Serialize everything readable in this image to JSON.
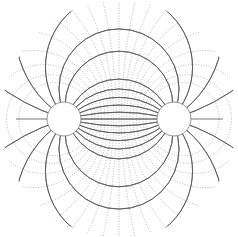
{
  "diagram": {
    "title": "",
    "type": "bipolar-coordinates field lines",
    "width": 238,
    "height": 237,
    "center": [
      119,
      119
    ],
    "focal_half_distance": 52,
    "colors": {
      "background": "#ffffff",
      "field_line": "#555555",
      "equipotential": "#999999",
      "conductor": "#777777"
    },
    "conductors": [
      {
        "name": "left-conductor",
        "cx": 64,
        "cy": 119,
        "r": 17
      },
      {
        "name": "right-conductor",
        "cx": 174,
        "cy": 119,
        "r": 17
      }
    ],
    "field_line_angles_deg": [
      15,
      30,
      45,
      60,
      75,
      90,
      105,
      120,
      135,
      150,
      165
    ],
    "equipotential_tau": [
      1.15,
      1.0,
      0.85,
      0.7,
      0.55,
      0.42,
      0.3,
      0.2,
      0.1
    ],
    "outer_clip_radius": 118
  }
}
